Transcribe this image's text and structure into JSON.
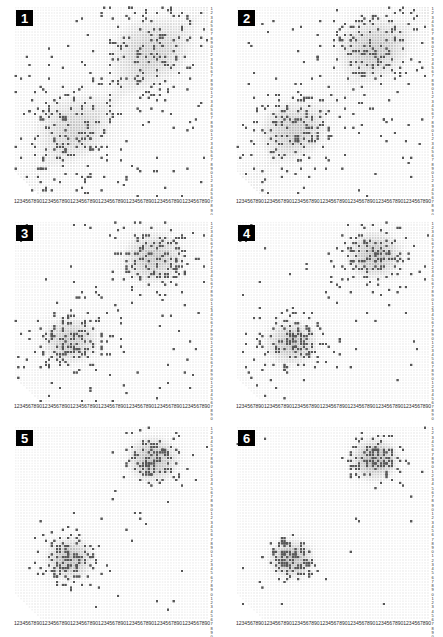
{
  "figure": {
    "layout": {
      "columns": 2,
      "rows": 3,
      "panel_count": 6
    },
    "background_color": "#ffffff",
    "badge_bg_color": "#000000",
    "badge_text_color": "#ffffff",
    "dot_color": "#555555",
    "grid_dot_color": "#e2e2e2",
    "density_shade_color": "#b9b9b9"
  },
  "axes": {
    "x_tick_labels": "1234567890123456789012345678901234567890123456789012345678901234567890",
    "y_tick_labels": "1234567890123456789012345678901234567890123456789012345678901234567890",
    "x_tick_unit": "1234567890",
    "y_tick_unit": "1234567890",
    "tick_repeat_count": 7,
    "xlabel": "",
    "ylabel": ""
  },
  "panels": [
    {
      "id": 1,
      "label": "1"
    },
    {
      "id": 2,
      "label": "2"
    },
    {
      "id": 3,
      "label": "3"
    },
    {
      "id": 4,
      "label": "4"
    },
    {
      "id": 5,
      "label": "5"
    },
    {
      "id": 6,
      "label": "6"
    }
  ],
  "chart_data": {
    "type": "scatter",
    "title": "",
    "xlabel": "",
    "ylabel": "",
    "xlim": [
      0,
      70
    ],
    "ylim": [
      0,
      70
    ],
    "grid": true,
    "series": [
      {
        "name": "panel-1",
        "panel": 1,
        "n_points": 430,
        "noise_fraction": 0.62,
        "clusters": [
          {
            "name": "lower-left",
            "cx": 20,
            "cy": 26,
            "sx": 9.0,
            "sy": 8.0,
            "n": 82,
            "peak_density": 0.42
          },
          {
            "name": "upper-right",
            "cx": 48,
            "cy": 54,
            "sx": 9.5,
            "sy": 8.5,
            "n": 82,
            "peak_density": 0.45
          }
        ]
      },
      {
        "name": "panel-2",
        "panel": 2,
        "n_points": 400,
        "noise_fraction": 0.52,
        "clusters": [
          {
            "name": "lower-left",
            "cx": 20,
            "cy": 25,
            "sx": 7.5,
            "sy": 6.5,
            "n": 96,
            "peak_density": 0.55
          },
          {
            "name": "upper-right",
            "cx": 49,
            "cy": 55,
            "sx": 8.0,
            "sy": 7.0,
            "n": 96,
            "peak_density": 0.58
          }
        ]
      },
      {
        "name": "panel-3",
        "panel": 3,
        "n_points": 370,
        "noise_fraction": 0.42,
        "clusters": [
          {
            "name": "lower-left",
            "cx": 20,
            "cy": 24,
            "sx": 6.5,
            "sy": 5.8,
            "n": 107,
            "peak_density": 0.66
          },
          {
            "name": "upper-right",
            "cx": 50,
            "cy": 56,
            "sx": 7.0,
            "sy": 6.2,
            "n": 107,
            "peak_density": 0.69
          }
        ]
      },
      {
        "name": "panel-4",
        "panel": 4,
        "n_points": 330,
        "noise_fraction": 0.3,
        "clusters": [
          {
            "name": "lower-left",
            "cx": 20,
            "cy": 23,
            "sx": 5.8,
            "sy": 5.2,
            "n": 115,
            "peak_density": 0.76
          },
          {
            "name": "upper-right",
            "cx": 50,
            "cy": 57,
            "sx": 6.2,
            "sy": 5.6,
            "n": 115,
            "peak_density": 0.79
          }
        ]
      },
      {
        "name": "panel-5",
        "panel": 5,
        "n_points": 280,
        "noise_fraction": 0.18,
        "clusters": [
          {
            "name": "lower-left",
            "cx": 20,
            "cy": 22,
            "sx": 5.2,
            "sy": 4.6,
            "n": 115,
            "peak_density": 0.86
          },
          {
            "name": "upper-right",
            "cx": 50,
            "cy": 58,
            "sx": 5.6,
            "sy": 5.0,
            "n": 115,
            "peak_density": 0.88
          }
        ]
      },
      {
        "name": "panel-6",
        "panel": 6,
        "n_points": 250,
        "noise_fraction": 0.1,
        "clusters": [
          {
            "name": "lower-left",
            "cx": 20,
            "cy": 22,
            "sx": 4.8,
            "sy": 4.2,
            "n": 112,
            "peak_density": 0.93
          },
          {
            "name": "upper-right",
            "cx": 50,
            "cy": 58,
            "sx": 5.2,
            "sy": 4.6,
            "n": 112,
            "peak_density": 0.95
          }
        ]
      }
    ]
  }
}
